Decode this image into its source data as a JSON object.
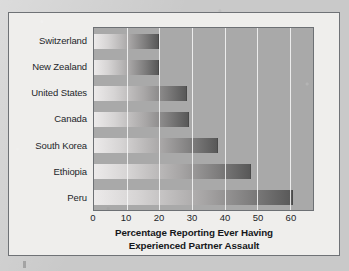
{
  "figure": {
    "kind": "horizontal-bar-chart-figure"
  },
  "chart_data": {
    "type": "bar",
    "orientation": "horizontal",
    "title": "",
    "xlabel": "Percentage Reporting Ever Having Experienced Partner Assault",
    "xlabel_line1": "Percentage Reporting Ever Having",
    "xlabel_line2": "Experienced Partner Assault",
    "ylabel": "",
    "categories": [
      "Switzerland",
      "New Zealand",
      "United States",
      "Canada",
      "South Korea",
      "Ethiopia",
      "Peru"
    ],
    "values": [
      20,
      20,
      28.5,
      29,
      38,
      48,
      61
    ],
    "xlim": [
      0,
      67
    ],
    "xticks": [
      0,
      10,
      20,
      30,
      40,
      50,
      60
    ],
    "xtick_labels": [
      "0",
      "10",
      "20",
      "30",
      "40",
      "50",
      "60"
    ],
    "grid": "vertical-white-gridlines",
    "legend": "none",
    "colors": {
      "plot_background": "#a9a9a9",
      "figure_background": "#efeeec",
      "page_background": "#c9c9c9",
      "gridline": "#f8f8f8",
      "bar_gradient_start": "#eceaea",
      "bar_gradient_end": "#585858",
      "frame_border": "#6f7276",
      "text": "#24262a"
    }
  }
}
